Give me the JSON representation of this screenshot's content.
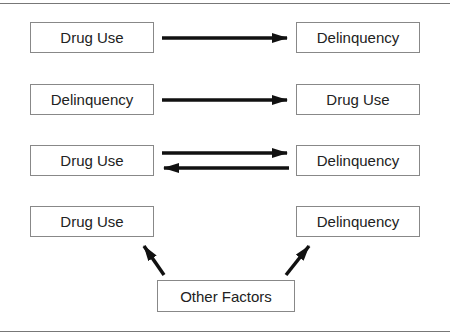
{
  "rows": [
    {
      "left": "Drug Use",
      "right": "Delinquency",
      "relation": "left-to-right"
    },
    {
      "left": "Delinquency",
      "right": "Drug Use",
      "relation": "left-to-right"
    },
    {
      "left": "Drug Use",
      "right": "Delinquency",
      "relation": "bidirectional"
    },
    {
      "left": "Drug Use",
      "right": "Delinquency",
      "relation": "common-cause"
    }
  ],
  "common_cause": "Other Factors"
}
